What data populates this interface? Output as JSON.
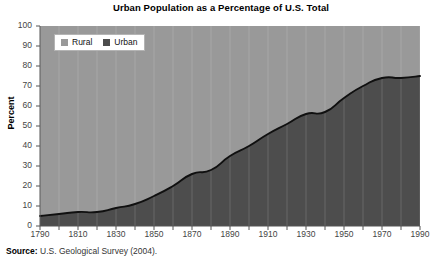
{
  "chart_data": {
    "type": "area",
    "title": "Urban Population as a Percentage of U.S. Total",
    "xlabel": "",
    "ylabel": "Percent",
    "xlim": [
      1790,
      1990
    ],
    "ylim": [
      0,
      100
    ],
    "grid": "vertical-minor",
    "legend_position": "top-left-inside",
    "x": [
      1790,
      1800,
      1810,
      1820,
      1830,
      1840,
      1850,
      1860,
      1870,
      1880,
      1890,
      1900,
      1910,
      1920,
      1930,
      1940,
      1950,
      1960,
      1970,
      1980,
      1990
    ],
    "series": [
      {
        "name": "Urban",
        "color": "#4d4d4d",
        "values": [
          5,
          6,
          7,
          7,
          9,
          11,
          15,
          20,
          26,
          28,
          35,
          40,
          46,
          51,
          56,
          57,
          64,
          70,
          74,
          74,
          75
        ]
      },
      {
        "name": "Rural",
        "color": "#999999",
        "values": [
          95,
          94,
          93,
          93,
          91,
          89,
          85,
          80,
          74,
          72,
          65,
          60,
          54,
          49,
          44,
          43,
          36,
          30,
          26,
          26,
          25
        ]
      }
    ],
    "xticks": [
      1790,
      1810,
      1830,
      1850,
      1870,
      1890,
      1910,
      1930,
      1950,
      1970,
      1990
    ],
    "xtick_labels": [
      "1790",
      "1810",
      "1830",
      "1850",
      "1870",
      "1890",
      "1910",
      "1930",
      "1950",
      "1970",
      "1990"
    ],
    "xminor_ticks": [
      1800,
      1820,
      1840,
      1860,
      1880,
      1900,
      1920,
      1940,
      1960,
      1980
    ],
    "yticks": [
      0,
      10,
      20,
      30,
      40,
      50,
      60,
      70,
      80,
      90,
      100
    ],
    "ytick_labels": [
      "0",
      "10",
      "20",
      "30",
      "40",
      "50",
      "60",
      "70",
      "80",
      "90",
      "100"
    ],
    "line_color": "#101010"
  },
  "legend": {
    "entries": [
      {
        "label": "Rural",
        "color": "#999999"
      },
      {
        "label": "Urban",
        "color": "#4d4d4d"
      }
    ]
  },
  "source": {
    "label": "Source:",
    "text": " U.S. Geological Survey (2004)."
  }
}
